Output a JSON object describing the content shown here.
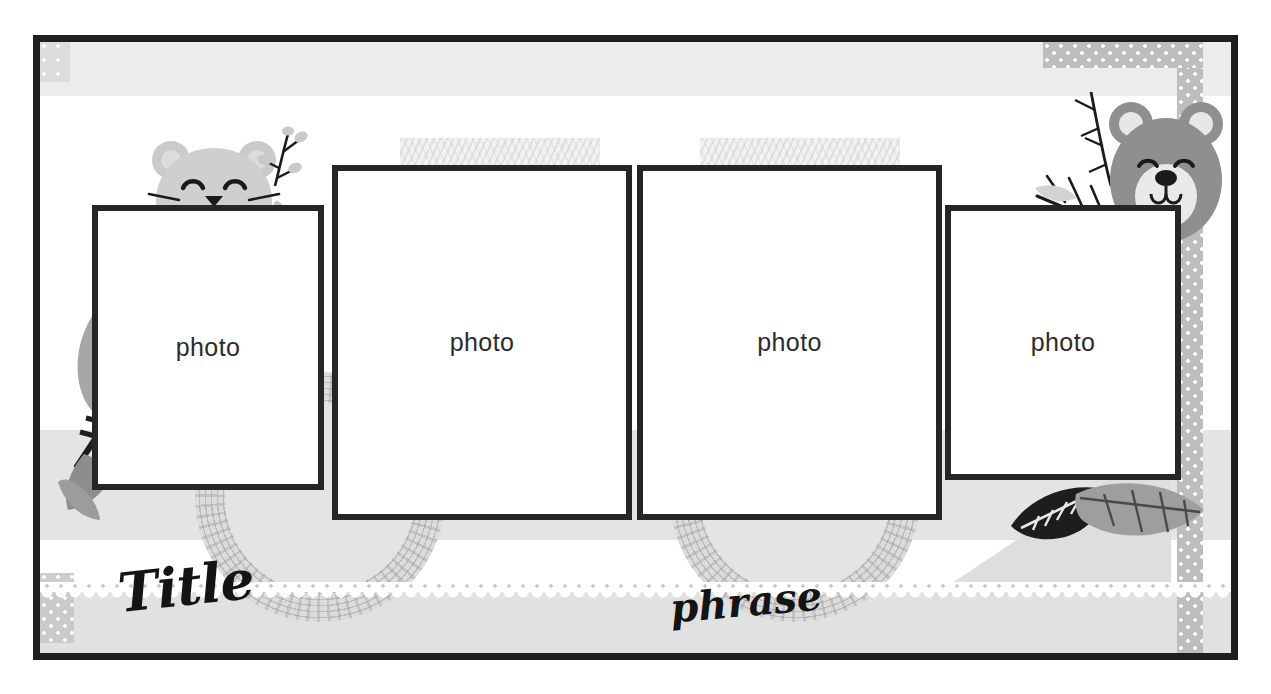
{
  "page": {
    "kind": "scrapbook-photo-layout-template",
    "width": 1271,
    "height": 694
  },
  "colors": {
    "frame_border": "#1f1f1f",
    "photo_border": "#262626",
    "band_gray": "#e4e4e4",
    "band_light_gray": "#ececec",
    "dot_strip": "#bdbdbd",
    "bear_body": "#8f8f8f",
    "cat_body": "#cfcfcf",
    "text_dark": "#141414",
    "leaf_gray": "#a5a5a5",
    "leaf_dark": "#1d1d1d"
  },
  "texts": {
    "title": "Title",
    "phrase": "phrase"
  },
  "photos": [
    {
      "label": "photo",
      "name": "photo-slot-1"
    },
    {
      "label": "photo",
      "name": "photo-slot-2"
    },
    {
      "label": "photo",
      "name": "photo-slot-3"
    },
    {
      "label": "photo",
      "name": "photo-slot-4"
    }
  ],
  "decorations": {
    "cat": "cat-face-icon",
    "bear": "bear-face-icon",
    "branch_left": "branch-icon",
    "branch_right": "branch-icon",
    "fern_left": "fern-icon",
    "fern_right": "fern-icon",
    "leaf_dark": "leaf-icon",
    "leaf_gray": "leaf-icon",
    "leaf_left_top": "leaf-icon",
    "leaf_left_bottom": "leaf-icon",
    "doily_left": "crochet-doily-icon",
    "doily_right": "crochet-doily-icon",
    "lace_border": "lace-trim-icon",
    "dot_strip": "polka-dot-tape-icon",
    "washi_left": "washi-tape-icon",
    "washi_right": "washi-tape-icon"
  }
}
